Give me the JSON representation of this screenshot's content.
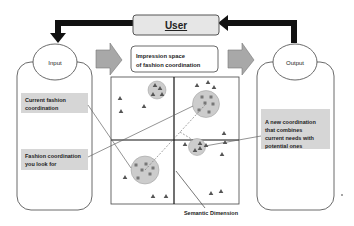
{
  "user_box": {
    "label": "User",
    "fill": "#e6e6e6"
  },
  "input_panel": {
    "title": "Input"
  },
  "output_panel": {
    "title": "Output"
  },
  "space_title": {
    "line1": "Impression space",
    "line2": "of fashion coordination"
  },
  "input_notes": [
    {
      "line1": "Current fashion",
      "line2": "coordination"
    },
    {
      "line1": "Fashion coordination",
      "line2": "you look for"
    }
  ],
  "output_note": {
    "lines": [
      "A new coordination",
      "that combines",
      "current needs with",
      "potential ones"
    ]
  },
  "axis_label": "Semantic Dimension",
  "colors": {
    "note_fill": "#d6d6d6",
    "cluster_fill": "#cccccc",
    "arrow_fill": "#a8a8a8",
    "marker": "#555555",
    "loop": "#111111"
  }
}
